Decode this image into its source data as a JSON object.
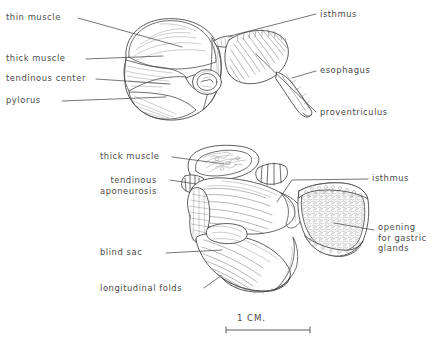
{
  "figure": {
    "scale_bar": {
      "label": "1 CM.",
      "length_px": 78
    },
    "ink_color": "#4a4a4a",
    "background_color": "#ffffff",
    "upper_view": {
      "name": "external view of gizzard, proventriculus and esophagus",
      "labels_left": [
        {
          "id": "thin-muscle",
          "text": "thin muscle"
        },
        {
          "id": "thick-muscle",
          "text": "thick muscle"
        },
        {
          "id": "tendinous-center",
          "text": "tendinous center"
        },
        {
          "id": "pylorus",
          "text": "pylorus"
        }
      ],
      "labels_right": [
        {
          "id": "isthmus",
          "text": "isthmus"
        },
        {
          "id": "esophagus",
          "text": "esophagus"
        },
        {
          "id": "proventriculus",
          "text": "proventriculus"
        }
      ]
    },
    "lower_view": {
      "name": "sectioned view showing interior of gizzard and proventriculus",
      "labels_left": [
        {
          "id": "thick-muscle",
          "text": "thick muscle"
        },
        {
          "id": "tendinous-aponeurosis",
          "text": "tendinous\naponeurosis"
        },
        {
          "id": "blind-sac",
          "text": "blind sac"
        },
        {
          "id": "longitudinal-folds",
          "text": "longitudinal folds"
        }
      ],
      "labels_right": [
        {
          "id": "isthmus",
          "text": "isthmus"
        },
        {
          "id": "opening-for-gastric-glands",
          "text": "opening\nfor gastric\nglands"
        }
      ]
    }
  }
}
